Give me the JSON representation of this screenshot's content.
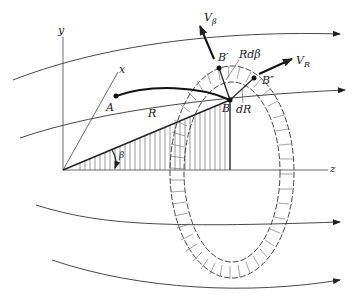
{
  "diagram": {
    "axes": {
      "y_label": "y",
      "x_label": "x",
      "z_label": "z"
    },
    "points": {
      "A": "A",
      "B": "B",
      "B_prime": "B′",
      "B_double_prime": "B″"
    },
    "labels": {
      "radius": "R",
      "angle": "β",
      "arc_length": "Rdβ",
      "radial_increment": "dR",
      "v_beta_main": "V",
      "v_beta_sub": "β",
      "v_r_main": "V",
      "v_r_sub": "R"
    },
    "colors": {
      "line": "#222222",
      "background": "#ffffff"
    }
  }
}
